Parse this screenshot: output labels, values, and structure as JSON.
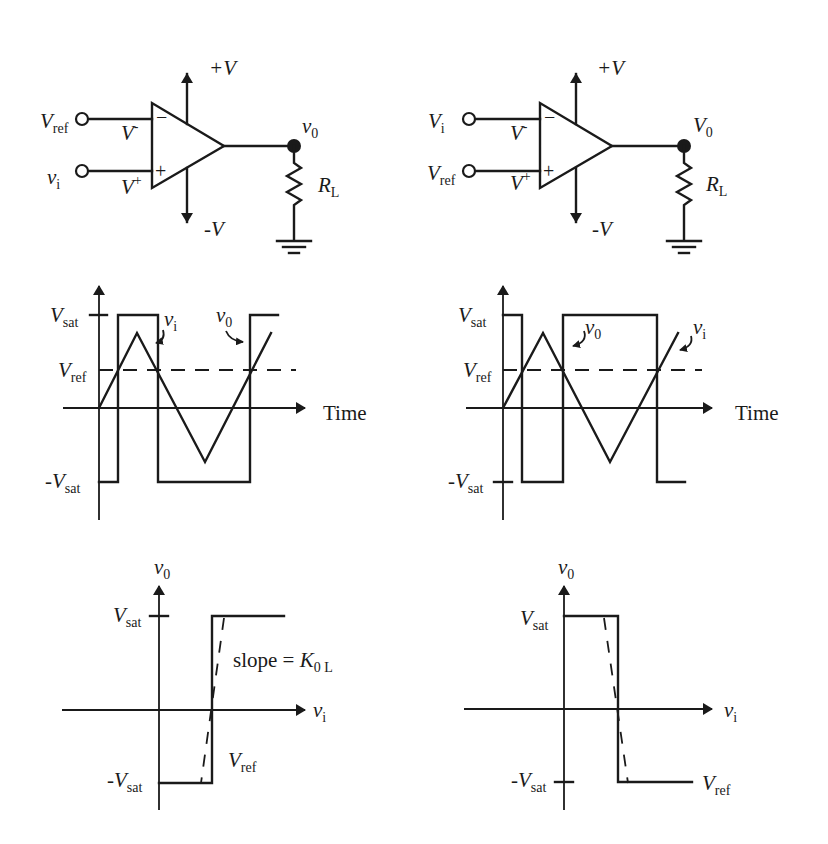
{
  "figure": {
    "panels": [
      {
        "id": "inverting",
        "circuit": {
          "input_top_label": {
            "main": "V",
            "sub": "ref"
          },
          "input_bottom_label": {
            "main": "v",
            "sub": "i"
          },
          "inv_pin_label": {
            "main": "V",
            "sup": "-"
          },
          "noninv_pin_label": {
            "main": "V",
            "sup": "+"
          },
          "inv_sign": "−",
          "noninv_sign": "+",
          "supply_pos": "+V",
          "supply_neg": "-V",
          "output_label": {
            "main": "v",
            "sub": "0"
          },
          "load_label": {
            "main": "R",
            "sub": "L"
          }
        },
        "waveform": {
          "vsat_label": {
            "main": "V",
            "sub": "sat"
          },
          "vref_label": {
            "main": "V",
            "sub": "ref"
          },
          "neg_vsat_label": {
            "main": "-V",
            "sub": "sat"
          },
          "time_label": "Time",
          "vi_label": {
            "main": "v",
            "sub": "i"
          },
          "vo_label": {
            "main": "v",
            "sub": "0"
          }
        },
        "transfer": {
          "y_label": {
            "main": "v",
            "sub": "0"
          },
          "x_label": {
            "main": "v",
            "sub": "i"
          },
          "vsat_label": {
            "main": "V",
            "sub": "sat"
          },
          "neg_vsat_label": {
            "main": "-V",
            "sub": "sat"
          },
          "vref_label": {
            "main": "V",
            "sub": "ref"
          },
          "slope_label": {
            "text": "slope = ",
            "main": "K",
            "sub": "0 L"
          }
        }
      },
      {
        "id": "noninverting",
        "circuit": {
          "input_top_label": {
            "main": "V",
            "sub": "i"
          },
          "input_bottom_label": {
            "main": "V",
            "sub": "ref"
          },
          "inv_pin_label": {
            "main": "V",
            "sup": "-"
          },
          "noninv_pin_label": {
            "main": "V",
            "sup": "+"
          },
          "inv_sign": "−",
          "noninv_sign": "+",
          "supply_pos": "+V",
          "supply_neg": "-V",
          "output_label": {
            "main": "V",
            "sub": "0"
          },
          "load_label": {
            "main": "R",
            "sub": "L"
          }
        },
        "waveform": {
          "vsat_label": {
            "main": "V",
            "sub": "sat"
          },
          "vref_label": {
            "main": "V",
            "sub": "ref"
          },
          "neg_vsat_label": {
            "main": "-V",
            "sub": "sat"
          },
          "time_label": "Time",
          "vi_label": {
            "main": "v",
            "sub": "i"
          },
          "vo_label": {
            "main": "v",
            "sub": "0"
          }
        },
        "transfer": {
          "y_label": {
            "main": "v",
            "sub": "0"
          },
          "x_label": {
            "main": "v",
            "sub": "i"
          },
          "vsat_label": {
            "main": "V",
            "sub": "sat"
          },
          "neg_vsat_label": {
            "main": "-V",
            "sub": "sat"
          },
          "vref_label": {
            "main": "V",
            "sub": "ref"
          }
        }
      }
    ]
  },
  "colors": {
    "ink": "#1a1a1a",
    "background": "#ffffff"
  }
}
